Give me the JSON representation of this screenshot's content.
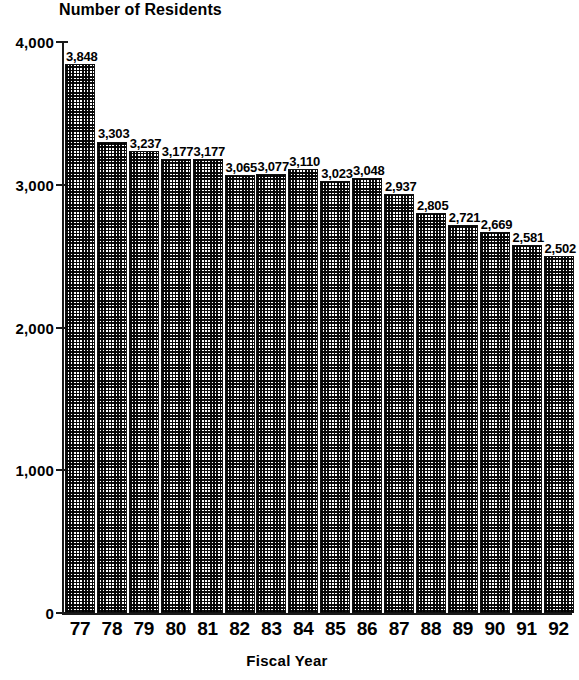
{
  "chart_data": {
    "type": "bar",
    "title": "Number of Residents",
    "xlabel": "Fiscal Year",
    "ylabel": "",
    "categories": [
      "77",
      "78",
      "79",
      "80",
      "81",
      "82",
      "83",
      "84",
      "85",
      "86",
      "87",
      "88",
      "89",
      "90",
      "91",
      "92"
    ],
    "values": [
      3848,
      3303,
      3237,
      3177,
      3177,
      3065,
      3077,
      3110,
      3023,
      3048,
      2937,
      2805,
      2721,
      2669,
      2581,
      2502
    ],
    "value_labels": [
      "3,848",
      "3,303",
      "3,237",
      "3,177",
      "3,177",
      "3,065",
      "3,077",
      "3,110",
      "3,023",
      "3,048",
      "2,937",
      "2,805",
      "2,721",
      "2,669",
      "2,581",
      "2,502"
    ],
    "ylim": [
      0,
      4000
    ],
    "ytick_values": [
      0,
      1000,
      2000,
      3000,
      4000
    ],
    "ytick_labels": [
      "0",
      "1,000",
      "2,000",
      "3,000",
      "4,000"
    ],
    "grid": false,
    "legend": null,
    "bar_color": "#8a8a8a",
    "bar_pattern": "checkerboard-dither",
    "bar_outline_color": "#111111",
    "axis_color": "#1a1a1a",
    "text_color": "#000000"
  }
}
